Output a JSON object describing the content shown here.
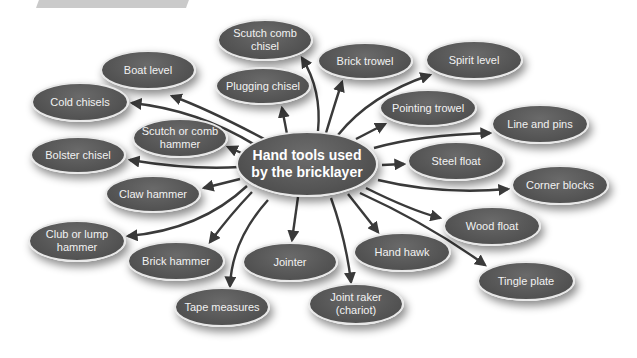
{
  "diagram": {
    "type": "mind-map",
    "center": {
      "label": "Hand tools used by the bricklayer",
      "x": 307,
      "y": 164,
      "w": 142,
      "h": 66
    },
    "colors": {
      "node_fill": "#555555",
      "node_border": "#e8e8e8",
      "text": "#f2f2f2",
      "arrow": "#3a3a3a",
      "background": "#ffffff"
    },
    "nodes": [
      {
        "id": "boat-level",
        "label": "Boat level",
        "x": 148,
        "y": 70,
        "w": 96,
        "h": 40
      },
      {
        "id": "scutch-comb-chisel",
        "label": "Scutch comb chisel",
        "x": 265,
        "y": 40,
        "w": 96,
        "h": 42
      },
      {
        "id": "plugging-chisel",
        "label": "Plugging chisel",
        "x": 263,
        "y": 86,
        "w": 96,
        "h": 38
      },
      {
        "id": "brick-trowel",
        "label": "Brick trowel",
        "x": 365,
        "y": 61,
        "w": 96,
        "h": 38
      },
      {
        "id": "spirit-level",
        "label": "Spirit level",
        "x": 474,
        "y": 60,
        "w": 98,
        "h": 40
      },
      {
        "id": "cold-chisels",
        "label": "Cold chisels",
        "x": 80,
        "y": 102,
        "w": 98,
        "h": 40
      },
      {
        "id": "scutch-or-comb-hammer",
        "label": "Scutch or comb hammer",
        "x": 180,
        "y": 138,
        "w": 96,
        "h": 40
      },
      {
        "id": "bolster-chisel",
        "label": "Bolster chisel",
        "x": 78,
        "y": 155,
        "w": 96,
        "h": 38
      },
      {
        "id": "pointing-trowel",
        "label": "Pointing trowel",
        "x": 428,
        "y": 108,
        "w": 98,
        "h": 38
      },
      {
        "id": "line-and-pins",
        "label": "Line and pins",
        "x": 540,
        "y": 124,
        "w": 98,
        "h": 40
      },
      {
        "id": "steel-float",
        "label": "Steel float",
        "x": 456,
        "y": 161,
        "w": 98,
        "h": 40
      },
      {
        "id": "corner-blocks",
        "label": "Corner blocks",
        "x": 560,
        "y": 185,
        "w": 98,
        "h": 40
      },
      {
        "id": "claw-hammer",
        "label": "Claw hammer",
        "x": 153,
        "y": 194,
        "w": 96,
        "h": 38
      },
      {
        "id": "club-or-lump-hammer",
        "label": "Club or lump hammer",
        "x": 77,
        "y": 241,
        "w": 98,
        "h": 42
      },
      {
        "id": "brick-hammer",
        "label": "Brick hammer",
        "x": 176,
        "y": 261,
        "w": 98,
        "h": 40
      },
      {
        "id": "jointer",
        "label": "Jointer",
        "x": 290,
        "y": 262,
        "w": 96,
        "h": 40
      },
      {
        "id": "hand-hawk",
        "label": "Hand hawk",
        "x": 402,
        "y": 252,
        "w": 98,
        "h": 40
      },
      {
        "id": "wood-float",
        "label": "Wood float",
        "x": 492,
        "y": 226,
        "w": 98,
        "h": 40
      },
      {
        "id": "tingle-plate",
        "label": "Tingle plate",
        "x": 526,
        "y": 281,
        "w": 98,
        "h": 40
      },
      {
        "id": "tape-measures",
        "label": "Tape measures",
        "x": 222,
        "y": 307,
        "w": 96,
        "h": 40
      },
      {
        "id": "joint-raker",
        "label": "Joint raker (chariot)",
        "x": 356,
        "y": 304,
        "w": 96,
        "h": 42
      }
    ],
    "arrows": [
      {
        "to": "boat-level",
        "d": "M268,141 Q210,110 172,96"
      },
      {
        "to": "scutch-comb-chisel",
        "d": "M318,131 Q322,90 302,58"
      },
      {
        "to": "plugging-chisel",
        "d": "M287,134 L282,108"
      },
      {
        "to": "brick-trowel",
        "d": "M326,133 Q336,100 342,82"
      },
      {
        "to": "spirit-level",
        "d": "M338,135 Q370,95 430,75"
      },
      {
        "to": "cold-chisels",
        "d": "M260,148 Q200,110 132,103"
      },
      {
        "to": "scutch-or-comb-hammer",
        "d": "M246,155 L228,147"
      },
      {
        "to": "bolster-chisel",
        "d": "M240,167 Q190,170 130,160"
      },
      {
        "to": "pointing-trowel",
        "d": "M356,139 L385,124"
      },
      {
        "to": "line-and-pins",
        "d": "M374,148 Q420,135 490,133"
      },
      {
        "to": "steel-float",
        "d": "M382,165 L404,164"
      },
      {
        "to": "corner-blocks",
        "d": "M378,180 Q440,195 508,189"
      },
      {
        "to": "claw-hammer",
        "d": "M240,179 L204,188"
      },
      {
        "to": "club-or-lump-hammer",
        "d": "M247,186 Q200,230 128,236"
      },
      {
        "to": "brick-hammer",
        "d": "M252,192 Q230,215 210,242"
      },
      {
        "to": "jointer",
        "d": "M298,197 L292,240"
      },
      {
        "to": "hand-hawk",
        "d": "M348,194 L378,232"
      },
      {
        "to": "wood-float",
        "d": "M366,188 Q410,210 440,218"
      },
      {
        "to": "tingle-plate",
        "d": "M360,193 Q430,225 485,265"
      },
      {
        "to": "tape-measures",
        "d": "M268,200 Q232,240 230,286"
      },
      {
        "to": "joint-raker",
        "d": "M331,198 Q346,240 351,282"
      }
    ]
  }
}
